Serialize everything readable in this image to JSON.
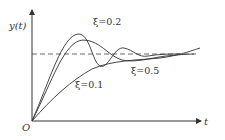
{
  "diagram": {
    "type": "step-response",
    "y_axis_label": "y(t)",
    "x_axis_label": "t",
    "origin_label": "O",
    "curves": [
      {
        "label": "ξ=0.2",
        "description": "largest overshoot, oscillatory"
      },
      {
        "label": "ξ=0.5",
        "description": "moderate overshoot"
      },
      {
        "label": "ξ=0.1",
        "description": "slow monotonic-like rise"
      }
    ],
    "reference_line": "steady-state value (dashed)"
  }
}
